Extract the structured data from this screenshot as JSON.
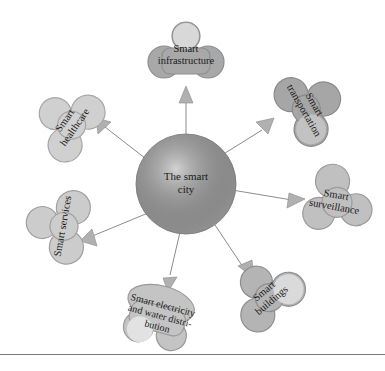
{
  "diagram": {
    "center": {
      "label_lines": [
        "The smart",
        "city"
      ],
      "color": "#9a9a9a"
    },
    "nodes": [
      {
        "id": "infrastructure",
        "label_lines": [
          "Smart",
          "infrastructure"
        ],
        "color": "#a8a8a8"
      },
      {
        "id": "transportation",
        "label_lines": [
          "Smart",
          "transportation"
        ],
        "color": "#a6a6a6"
      },
      {
        "id": "surveillance",
        "label_lines": [
          "Smart",
          "surveillance"
        ],
        "color": "#c0c0c0"
      },
      {
        "id": "buildings",
        "label_lines": [
          "Smart",
          "buildings"
        ],
        "color": "#b4b4b4"
      },
      {
        "id": "electricity",
        "label_lines": [
          "Smart electricity",
          "and water distri-",
          "bution"
        ],
        "color": "#c4c4c4"
      },
      {
        "id": "services",
        "label_lines": [
          "Smart services"
        ],
        "color": "#cccccc"
      },
      {
        "id": "healthcare",
        "label_lines": [
          "Smart",
          "healthcare"
        ],
        "color": "#d0d0d0"
      }
    ],
    "connector_color": "#8c8c8c",
    "arrow_color": "#b0b0b0"
  }
}
